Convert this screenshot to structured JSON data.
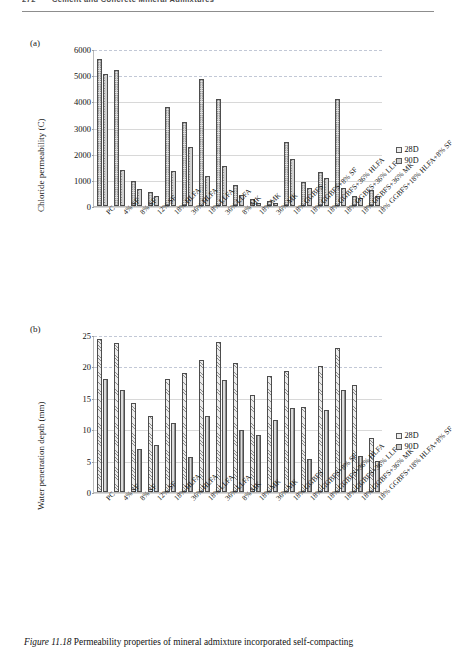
{
  "running_head": {
    "page_number": "272",
    "title": "Cement and Concrete Mineral Admixtures"
  },
  "figure": {
    "caption_label": "Figure 11.18",
    "caption_text": "Permeability properties of mineral admixture incorporated self-compacting"
  },
  "panels": {
    "a": {
      "tag": "(a)"
    },
    "b": {
      "tag": "(b)"
    }
  },
  "legend": {
    "items": [
      {
        "label": "28D",
        "color": "#ededed"
      },
      {
        "label": "90D",
        "color": "#cfcfcf"
      }
    ]
  },
  "categories": [
    "PC",
    "4% SF",
    "8% SF",
    "12% SF",
    "18% HLFA",
    "36% HLFA",
    "18% LLFA",
    "36% LLFA",
    "8% MK",
    "18% MK",
    "36% MK",
    "18% GGBFS",
    "18% GGBFS+8% SF",
    "18% GGBFS+36% HLFA",
    "18% GGBFS+36% LLFA",
    "18% GGBFS+36% MK",
    "18% GGBFS+18% HLFA+8% SF"
  ],
  "chart_data": [
    {
      "type": "bar",
      "title": "",
      "panel": "(a)",
      "xlabel": "",
      "ylabel": "Chloride permeability (C)",
      "ylim": [
        0,
        6000
      ],
      "yticks": [
        0,
        1000,
        2000,
        3000,
        4000,
        5000,
        6000
      ],
      "grid": true,
      "legend_position": "right",
      "categories": [
        "PC",
        "4% SF",
        "8% SF",
        "12% SF",
        "18% HLFA",
        "36% HLFA",
        "18% LLFA",
        "36% LLFA",
        "8% MK",
        "18% MK",
        "36% MK",
        "18% GGBFS",
        "18% GGBFS+8% SF",
        "18% GGBFS+36% HLFA",
        "18% GGBFS+36% LLFA",
        "18% GGBFS+36% MK",
        "18% GGBFS+18% HLFA+8% SF"
      ],
      "series": [
        {
          "name": "28D",
          "values": [
            5600,
            5180,
            950,
            520,
            3800,
            3200,
            4850,
            4100,
            820,
            250,
            180,
            2450,
            900,
            1300,
            4100,
            400,
            600
          ]
        },
        {
          "name": "90D",
          "values": [
            5050,
            1380,
            660,
            380,
            1320,
            2240,
            1160,
            1540,
            430,
            130,
            120,
            1800,
            680,
            1080,
            700,
            290,
            400
          ]
        }
      ]
    },
    {
      "type": "bar",
      "title": "",
      "panel": "(b)",
      "xlabel": "",
      "ylabel": "Water penetration depth (mm)",
      "ylim": [
        0,
        25
      ],
      "yticks": [
        0,
        5,
        10,
        15,
        20,
        25
      ],
      "grid": true,
      "legend_position": "right",
      "categories": [
        "PC",
        "4% SF",
        "8% SF",
        "12% SF",
        "18% HLFA",
        "36% HLFA",
        "18% LLFA",
        "36% LLFA",
        "8% MK",
        "18% MK",
        "36% MK",
        "18% GGBFS",
        "18% GGBFS+8% SF",
        "18% GGBFS+36% HLFA",
        "18% GGBFS+36% LLFA",
        "18% GGBFS+36% MK",
        "18% GGBFS+18% HLFA+8% SF"
      ],
      "series": [
        {
          "name": "28D",
          "values": [
            24.4,
            23.7,
            14.2,
            12.1,
            18.0,
            19.0,
            21.0,
            23.9,
            20.6,
            15.5,
            18.4,
            19.3,
            13.5,
            20.0,
            22.9,
            17.1,
            8.6
          ]
        },
        {
          "name": "90D",
          "values": [
            18.0,
            16.2,
            6.8,
            7.5,
            11.0,
            5.5,
            12.1,
            17.8,
            9.9,
            9.1,
            11.5,
            13.3,
            5.2,
            13.0,
            16.2,
            5.8,
            5.0
          ]
        }
      ]
    }
  ]
}
